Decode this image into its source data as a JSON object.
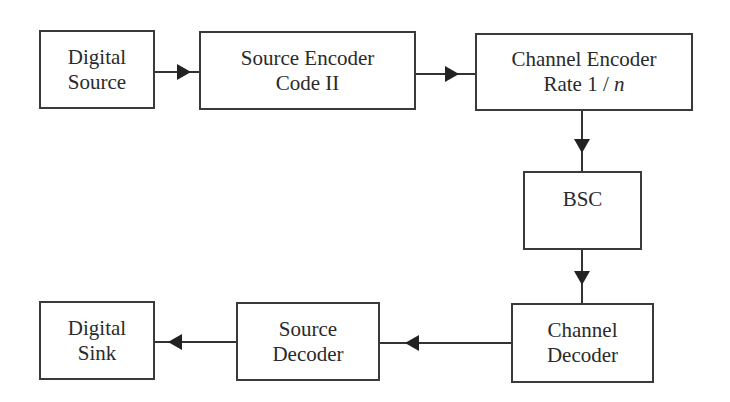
{
  "diagram": {
    "type": "block-diagram",
    "title": "",
    "nodes": [
      {
        "id": "digital-source",
        "lines": [
          "Digital",
          "Source"
        ]
      },
      {
        "id": "source-encoder",
        "lines": [
          "Source Encoder",
          "Code II"
        ]
      },
      {
        "id": "channel-encoder",
        "lines": [
          "Channel Encoder",
          "Rate 1 / "
        ],
        "rate_variable": "n"
      },
      {
        "id": "bsc",
        "lines": [
          "BSC"
        ]
      },
      {
        "id": "channel-decoder",
        "lines": [
          "Channel",
          "Decoder"
        ]
      },
      {
        "id": "source-decoder",
        "lines": [
          "Source",
          "Decoder"
        ]
      },
      {
        "id": "digital-sink",
        "lines": [
          "Digital",
          "Sink"
        ]
      }
    ],
    "edges": [
      {
        "from": "digital-source",
        "to": "source-encoder"
      },
      {
        "from": "source-encoder",
        "to": "channel-encoder"
      },
      {
        "from": "channel-encoder",
        "to": "bsc"
      },
      {
        "from": "bsc",
        "to": "channel-decoder"
      },
      {
        "from": "channel-decoder",
        "to": "source-decoder"
      },
      {
        "from": "source-decoder",
        "to": "digital-sink"
      }
    ],
    "colors": {
      "stroke": "#3a3a3a",
      "text": "#2a2a2a",
      "background": "#ffffff"
    }
  }
}
